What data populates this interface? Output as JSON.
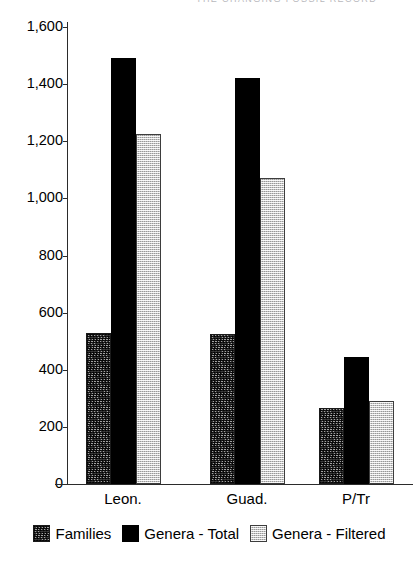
{
  "header": {
    "running_text": "THE CHANGING FOSSIL RECORD"
  },
  "chart_data": {
    "type": "bar",
    "title": "",
    "subtitle": "",
    "xlabel": "",
    "ylabel": "",
    "categories": [
      "Leon.",
      "Guad.",
      "P/Tr"
    ],
    "series": [
      {
        "name": "Families",
        "values": [
          530,
          525,
          265
        ],
        "color": "#6e6e6e",
        "pattern": "dense-speckle"
      },
      {
        "name": "Genera - Total",
        "values": [
          1490,
          1420,
          445
        ],
        "color": "#000000",
        "pattern": "solid"
      },
      {
        "name": "Genera - Filtered",
        "values": [
          1225,
          1070,
          290
        ],
        "color": "#c9c9c9",
        "pattern": "light-stipple"
      }
    ],
    "ylim": [
      0,
      1600
    ],
    "ytick_step": 200,
    "yticks": [
      1600,
      1400,
      1200,
      1000,
      800,
      600,
      400,
      200,
      0
    ],
    "ytick_labels": [
      "1,600",
      "1,400",
      "1,200",
      "1,000",
      "800",
      "600",
      "400",
      "200",
      "0"
    ],
    "grid": false,
    "legend_position": "bottom",
    "legend_entries": [
      "Families",
      "Genera - Total",
      "Genera - Filtered"
    ]
  }
}
